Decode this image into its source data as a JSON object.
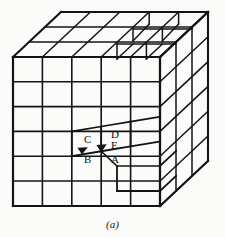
{
  "figure": {
    "caption": "(a)",
    "title": "",
    "background_color": "#fbfbfa",
    "line_color": "#141414",
    "labels": [
      {
        "text": "C",
        "x": 84,
        "y": 134,
        "name": "vertex-label-c"
      },
      {
        "text": "D",
        "x": 111,
        "y": 130,
        "name": "vertex-label-d"
      },
      {
        "text": "E",
        "x": 111,
        "y": 141,
        "name": "vertex-label-e"
      },
      {
        "text": "B",
        "x": 84,
        "y": 154,
        "name": "vertex-label-b"
      },
      {
        "text": "A",
        "x": 111,
        "y": 154,
        "name": "vertex-label-a"
      }
    ]
  },
  "geometry": {
    "description": "Isometric block-model cube with stepped surface; front face 6x5 grid, top face grid, right face grid",
    "front": {
      "left": 13,
      "right": 160,
      "top": 57,
      "bottom": 206,
      "cols": 5,
      "rows": 6
    },
    "depth": {
      "dx": 48,
      "dy": -45
    },
    "top": {
      "cols": 5,
      "rows": 3
    },
    "right": {
      "cols": 3,
      "rows": 6
    }
  }
}
